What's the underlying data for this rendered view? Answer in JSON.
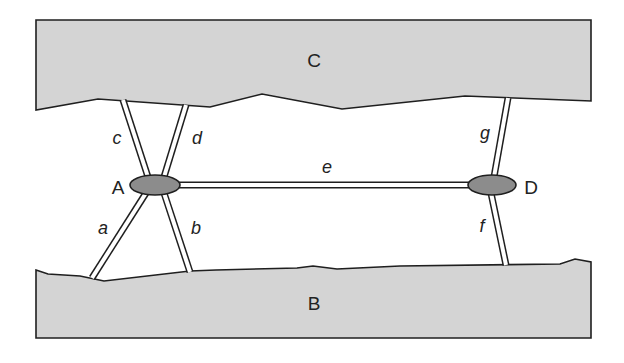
{
  "diagram": {
    "type": "strut-network",
    "regions": {
      "top": {
        "label": "C",
        "fill": "#d4d4d4"
      },
      "bottom": {
        "label": "B",
        "fill": "#d4d4d4"
      }
    },
    "nodes": [
      {
        "id": "A",
        "label": "A",
        "fill": "#8c8c8c"
      },
      {
        "id": "D",
        "label": "D",
        "fill": "#8c8c8c"
      }
    ],
    "struts": [
      {
        "id": "a",
        "label": "a",
        "from": "A",
        "to": "B"
      },
      {
        "id": "b",
        "label": "b",
        "from": "A",
        "to": "B"
      },
      {
        "id": "c",
        "label": "c",
        "from": "A",
        "to": "C"
      },
      {
        "id": "d",
        "label": "d",
        "from": "A",
        "to": "C"
      },
      {
        "id": "e",
        "label": "e",
        "from": "A",
        "to": "D"
      },
      {
        "id": "f",
        "label": "f",
        "from": "D",
        "to": "B"
      },
      {
        "id": "g",
        "label": "g",
        "from": "D",
        "to": "C"
      }
    ],
    "colors": {
      "outline": "#1f1f1f",
      "region_fill": "#d4d4d4",
      "node_fill": "#8c8c8c",
      "background": "#ffffff"
    }
  }
}
